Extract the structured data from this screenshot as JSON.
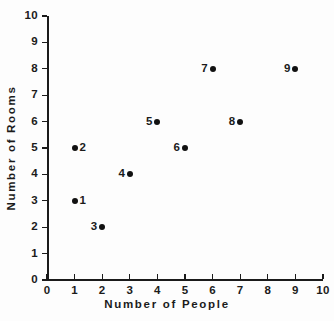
{
  "chart_data": {
    "type": "scatter",
    "title": "",
    "xlabel": "Number of People",
    "ylabel": "Number of Rooms",
    "xlim": [
      0,
      10
    ],
    "ylim": [
      0,
      10
    ],
    "grid": false,
    "legend": null,
    "xticks": [
      "0",
      "1",
      "2",
      "3",
      "4",
      "5",
      "6",
      "7",
      "8",
      "9",
      "10"
    ],
    "yticks": [
      "0",
      "1",
      "2",
      "3",
      "4",
      "5",
      "6",
      "7",
      "8",
      "9",
      "10"
    ],
    "x": [
      1,
      1,
      2,
      3,
      4,
      5,
      6,
      7,
      9
    ],
    "y": [
      3,
      5,
      2,
      4,
      6,
      5,
      8,
      6,
      8
    ],
    "point_labels": [
      "1",
      "2",
      "3",
      "4",
      "5",
      "6",
      "7",
      "8",
      "9"
    ],
    "points": [
      {
        "label": "1",
        "x": 1,
        "y": 3,
        "label_side": "right"
      },
      {
        "label": "2",
        "x": 1,
        "y": 5,
        "label_side": "right"
      },
      {
        "label": "3",
        "x": 2,
        "y": 2,
        "label_side": "left"
      },
      {
        "label": "4",
        "x": 3,
        "y": 4,
        "label_side": "left"
      },
      {
        "label": "5",
        "x": 4,
        "y": 6,
        "label_side": "left"
      },
      {
        "label": "6",
        "x": 5,
        "y": 5,
        "label_side": "left"
      },
      {
        "label": "7",
        "x": 6,
        "y": 8,
        "label_side": "left"
      },
      {
        "label": "8",
        "x": 7,
        "y": 6,
        "label_side": "left"
      },
      {
        "label": "9",
        "x": 9,
        "y": 8,
        "label_side": "left"
      }
    ],
    "marker_color": "#111111",
    "axis_color": "#1b1b1b",
    "background_color": "#fdfdfd"
  }
}
